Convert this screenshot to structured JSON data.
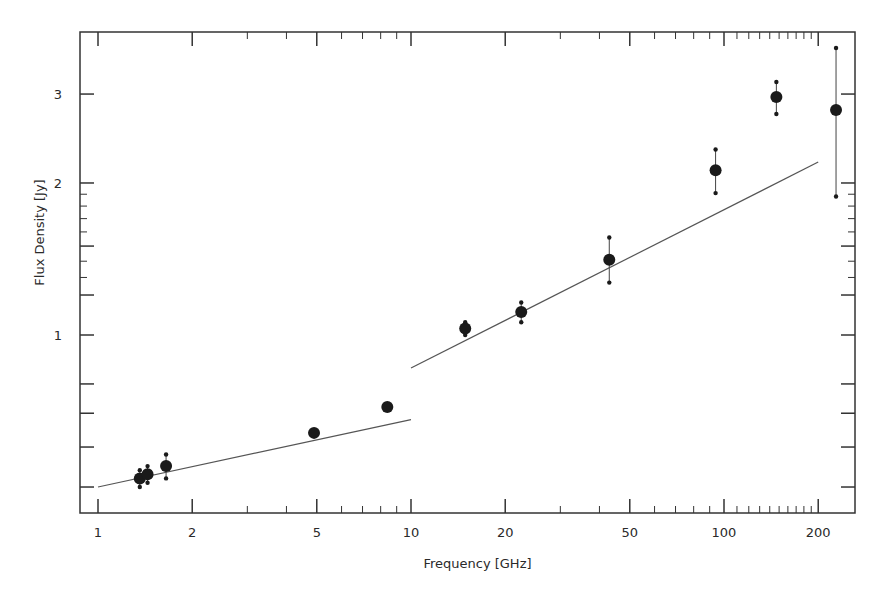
{
  "chart_data": {
    "type": "scatter",
    "title": "",
    "xlabel": "Frequency [GHz]",
    "ylabel": "Flux Density [Jy]",
    "xscale": "log",
    "yscale": "log",
    "xlim": [
      0.85,
      260
    ],
    "ylim": [
      0.45,
      3.8
    ],
    "grid": false,
    "legend": null,
    "x_ticks": [
      1,
      2,
      5,
      10,
      20,
      50,
      100,
      200
    ],
    "x_tick_labels": [
      "1",
      "2",
      "5",
      "10",
      "20",
      "50",
      "100",
      "200"
    ],
    "y_ticks": [
      1,
      2,
      3
    ],
    "y_tick_labels": [
      "1",
      "2",
      "3"
    ],
    "y_minor_ticks": [
      0.5,
      0.6,
      0.7,
      0.8,
      1.2,
      1.5,
      1.6,
      1.7,
      1.8,
      1.9
    ],
    "series": [
      {
        "name": "measurements",
        "kind": "points_with_errorbars",
        "x": [
          1.36,
          1.44,
          1.65,
          4.9,
          8.4,
          14.9,
          22.5,
          43,
          94,
          147,
          228
        ],
        "y": [
          0.52,
          0.53,
          0.55,
          0.64,
          0.72,
          1.03,
          1.11,
          1.41,
          2.12,
          2.96,
          2.79
        ],
        "y_low": [
          0.5,
          0.51,
          0.52,
          0.64,
          0.72,
          1.0,
          1.06,
          1.27,
          1.91,
          2.74,
          1.88
        ],
        "y_high": [
          0.54,
          0.55,
          0.58,
          0.64,
          0.72,
          1.06,
          1.16,
          1.56,
          2.33,
          3.17,
          3.7
        ]
      },
      {
        "name": "fit-low",
        "kind": "line",
        "x": [
          1.0,
          10.0
        ],
        "y": [
          0.5,
          0.68
        ]
      },
      {
        "name": "fit-high",
        "kind": "line",
        "x": [
          10.0,
          200.0
        ],
        "y": [
          0.86,
          2.2
        ]
      }
    ]
  },
  "layout": {
    "plot_left": 80,
    "plot_top": 32,
    "plot_right": 855,
    "plot_bottom": 513,
    "x_px_at_1": 98,
    "x_px_per_decade": 313,
    "y_px_at_1": 335,
    "y_px_per_decade": 505,
    "point_color": "#1a1a1a",
    "line_color": "#555555",
    "axis_color": "#333333"
  }
}
